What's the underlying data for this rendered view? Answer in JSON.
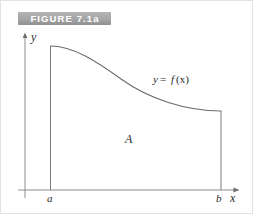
{
  "figure": {
    "banner_label": "FIGURE 7.1a",
    "banner_color": "#a6a6a6",
    "banner_text_color": "#ffffff"
  },
  "axes": {
    "y_axis_label": "y",
    "x_axis_label": "x",
    "stroke_color": "#8c8c8c"
  },
  "ticks": {
    "left_bound_label": "a",
    "right_bound_label": "b"
  },
  "region": {
    "area_label": "A",
    "fill_color": "#ffffff",
    "edge_color": "#7b7b7b"
  },
  "curve": {
    "function_label": "y = f(x)",
    "function_label_y": "y",
    "function_label_eq": "=",
    "function_label_f": "f",
    "function_label_arg": "(x)",
    "stroke_color": "#6b6b6b"
  }
}
